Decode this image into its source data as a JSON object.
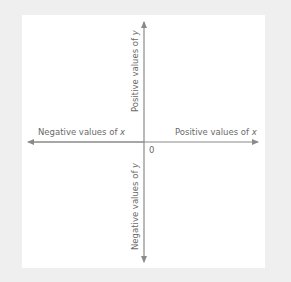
{
  "diagram": {
    "type": "cartesian-axes",
    "labels": {
      "positive_y": "Positive values of ",
      "positive_y_var": "y",
      "negative_y": "Negative values of ",
      "negative_y_var": "y",
      "negative_x": "Negative values of ",
      "negative_x_var": "x",
      "positive_x": "Positive values of ",
      "positive_x_var": "x",
      "origin": "0"
    },
    "colors": {
      "background": "#efefef",
      "panel": "#ffffff",
      "axis": "#8a8a8a",
      "text": "#6a6a6a"
    }
  }
}
